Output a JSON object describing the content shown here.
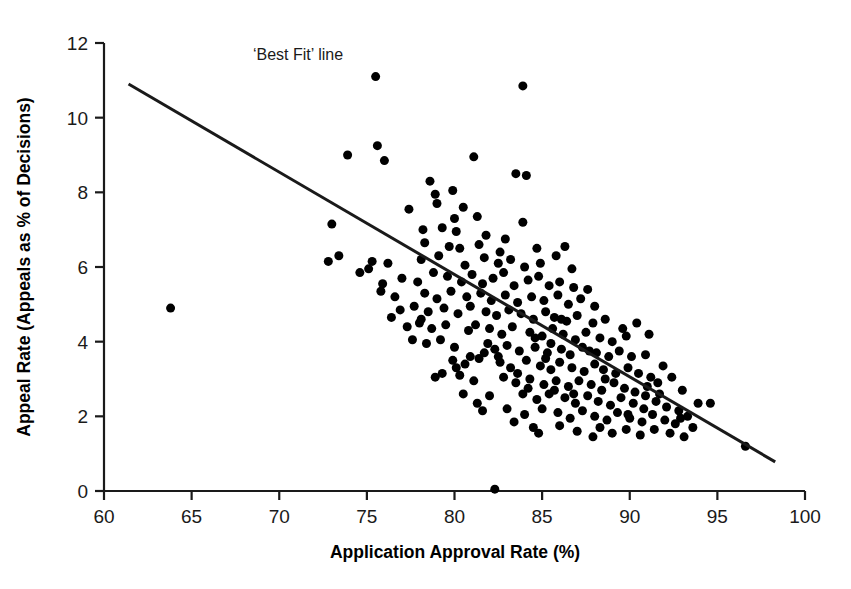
{
  "chart_data": {
    "type": "scatter",
    "title": "",
    "xlabel": "Application Approval Rate (%)",
    "ylabel": "Appeal Rate (Appeals as % of Decisions)",
    "xlim": [
      60,
      100
    ],
    "ylim": [
      0,
      12
    ],
    "xticks": [
      60,
      65,
      70,
      75,
      80,
      85,
      90,
      95,
      100
    ],
    "yticks": [
      0,
      2,
      4,
      6,
      8,
      10,
      12
    ],
    "xtick_labels": [
      "60",
      "65",
      "70",
      "75",
      "80",
      "85",
      "90",
      "95",
      "100"
    ],
    "ytick_labels": [
      "0",
      "2",
      "4",
      "6",
      "8",
      "10",
      "12"
    ],
    "grid": false,
    "legend": false,
    "marker": "filled-circle",
    "marker_color": "#000000",
    "marker_size_px": 9,
    "annotations": [
      {
        "name": "best-fit-line-label",
        "text": "‘Best Fit’ line",
        "x": 68.5,
        "y": 11.55
      }
    ],
    "trendline": {
      "name": "Best Fit line",
      "type": "linear",
      "color": "#1a1a1a",
      "width_px": 3,
      "x_start": 61.4,
      "y_start": 10.9,
      "x_end": 98.3,
      "y_end": 0.78,
      "slope": -0.274,
      "intercept": 27.72
    },
    "series": [
      {
        "name": "Local authorities",
        "points": [
          [
            63.8,
            4.9
          ],
          [
            75.5,
            11.1
          ],
          [
            83.9,
            10.85
          ],
          [
            73.9,
            9.0
          ],
          [
            75.6,
            9.25
          ],
          [
            76.0,
            8.85
          ],
          [
            81.1,
            8.95
          ],
          [
            83.5,
            8.5
          ],
          [
            84.1,
            8.45
          ],
          [
            78.6,
            8.3
          ],
          [
            78.9,
            7.95
          ],
          [
            79.9,
            8.05
          ],
          [
            77.4,
            7.55
          ],
          [
            80.5,
            7.6
          ],
          [
            81.3,
            7.35
          ],
          [
            83.9,
            7.2
          ],
          [
            78.2,
            7.0
          ],
          [
            79.3,
            7.05
          ],
          [
            80.1,
            6.95
          ],
          [
            73.0,
            7.15
          ],
          [
            79.7,
            6.55
          ],
          [
            80.3,
            6.5
          ],
          [
            81.4,
            6.6
          ],
          [
            82.6,
            6.4
          ],
          [
            84.7,
            6.5
          ],
          [
            86.3,
            6.55
          ],
          [
            72.8,
            6.15
          ],
          [
            73.4,
            6.3
          ],
          [
            75.3,
            6.15
          ],
          [
            76.2,
            6.1
          ],
          [
            78.1,
            6.2
          ],
          [
            79.1,
            6.3
          ],
          [
            80.6,
            6.05
          ],
          [
            81.7,
            6.25
          ],
          [
            82.5,
            6.1
          ],
          [
            83.2,
            6.2
          ],
          [
            84.0,
            6.0
          ],
          [
            84.9,
            6.1
          ],
          [
            85.8,
            6.3
          ],
          [
            86.7,
            5.95
          ],
          [
            77.0,
            5.7
          ],
          [
            77.9,
            5.6
          ],
          [
            78.8,
            5.85
          ],
          [
            79.6,
            5.75
          ],
          [
            80.4,
            5.6
          ],
          [
            81.0,
            5.8
          ],
          [
            81.6,
            5.55
          ],
          [
            82.2,
            5.7
          ],
          [
            82.8,
            5.85
          ],
          [
            83.4,
            5.5
          ],
          [
            84.2,
            5.65
          ],
          [
            84.8,
            5.75
          ],
          [
            85.4,
            5.5
          ],
          [
            86.0,
            5.6
          ],
          [
            86.8,
            5.45
          ],
          [
            87.6,
            5.4
          ],
          [
            75.8,
            5.35
          ],
          [
            76.6,
            5.2
          ],
          [
            78.3,
            5.3
          ],
          [
            79.0,
            5.15
          ],
          [
            79.8,
            5.35
          ],
          [
            80.7,
            5.2
          ],
          [
            81.5,
            5.3
          ],
          [
            82.1,
            5.1
          ],
          [
            82.9,
            5.25
          ],
          [
            83.6,
            5.05
          ],
          [
            84.4,
            5.2
          ],
          [
            85.1,
            5.1
          ],
          [
            85.9,
            5.25
          ],
          [
            86.5,
            5.0
          ],
          [
            87.2,
            5.15
          ],
          [
            88.0,
            4.95
          ],
          [
            76.9,
            4.85
          ],
          [
            77.7,
            4.95
          ],
          [
            78.5,
            4.8
          ],
          [
            79.4,
            4.9
          ],
          [
            80.2,
            4.75
          ],
          [
            80.9,
            4.95
          ],
          [
            81.8,
            4.8
          ],
          [
            82.4,
            4.7
          ],
          [
            83.1,
            4.85
          ],
          [
            83.8,
            4.75
          ],
          [
            84.5,
            4.6
          ],
          [
            85.2,
            4.8
          ],
          [
            85.7,
            4.65
          ],
          [
            86.4,
            4.55
          ],
          [
            87.0,
            4.7
          ],
          [
            87.9,
            4.5
          ],
          [
            88.6,
            4.6
          ],
          [
            77.3,
            4.4
          ],
          [
            78.0,
            4.5
          ],
          [
            78.7,
            4.35
          ],
          [
            79.5,
            4.45
          ],
          [
            80.8,
            4.3
          ],
          [
            81.2,
            4.45
          ],
          [
            82.0,
            4.35
          ],
          [
            82.7,
            4.2
          ],
          [
            83.3,
            4.4
          ],
          [
            84.3,
            4.25
          ],
          [
            85.0,
            4.15
          ],
          [
            85.6,
            4.35
          ],
          [
            86.2,
            4.2
          ],
          [
            86.9,
            4.05
          ],
          [
            87.5,
            4.25
          ],
          [
            88.3,
            4.1
          ],
          [
            89.0,
            4.0
          ],
          [
            89.8,
            4.15
          ],
          [
            78.4,
            3.95
          ],
          [
            79.2,
            4.05
          ],
          [
            80.0,
            3.85
          ],
          [
            81.9,
            3.95
          ],
          [
            82.3,
            3.8
          ],
          [
            83.0,
            3.9
          ],
          [
            83.7,
            3.75
          ],
          [
            84.6,
            3.85
          ],
          [
            85.3,
            3.7
          ],
          [
            85.5,
            3.95
          ],
          [
            86.1,
            3.8
          ],
          [
            86.6,
            3.65
          ],
          [
            87.3,
            3.85
          ],
          [
            88.1,
            3.7
          ],
          [
            88.8,
            3.6
          ],
          [
            89.4,
            3.75
          ],
          [
            90.1,
            3.6
          ],
          [
            90.9,
            3.65
          ],
          [
            79.9,
            3.5
          ],
          [
            80.6,
            3.4
          ],
          [
            81.4,
            3.55
          ],
          [
            82.6,
            3.45
          ],
          [
            83.2,
            3.3
          ],
          [
            84.1,
            3.5
          ],
          [
            84.9,
            3.35
          ],
          [
            85.5,
            3.25
          ],
          [
            86.0,
            3.45
          ],
          [
            86.7,
            3.3
          ],
          [
            87.4,
            3.2
          ],
          [
            88.0,
            3.4
          ],
          [
            88.5,
            3.25
          ],
          [
            89.2,
            3.15
          ],
          [
            89.9,
            3.3
          ],
          [
            90.5,
            3.15
          ],
          [
            91.2,
            3.05
          ],
          [
            78.9,
            3.05
          ],
          [
            80.3,
            3.1
          ],
          [
            81.1,
            2.95
          ],
          [
            82.8,
            3.05
          ],
          [
            83.5,
            2.9
          ],
          [
            84.3,
            3.0
          ],
          [
            85.1,
            2.85
          ],
          [
            85.8,
            2.95
          ],
          [
            86.5,
            2.8
          ],
          [
            87.1,
            2.95
          ],
          [
            87.8,
            2.85
          ],
          [
            88.4,
            2.7
          ],
          [
            89.1,
            2.9
          ],
          [
            89.7,
            2.75
          ],
          [
            90.3,
            2.65
          ],
          [
            91.0,
            2.8
          ],
          [
            91.7,
            2.6
          ],
          [
            82.0,
            2.55
          ],
          [
            83.9,
            2.6
          ],
          [
            84.7,
            2.45
          ],
          [
            85.4,
            2.6
          ],
          [
            86.3,
            2.5
          ],
          [
            86.9,
            2.35
          ],
          [
            87.6,
            2.55
          ],
          [
            88.2,
            2.4
          ],
          [
            88.9,
            2.3
          ],
          [
            89.5,
            2.5
          ],
          [
            90.2,
            2.35
          ],
          [
            90.8,
            2.2
          ],
          [
            91.5,
            2.4
          ],
          [
            92.1,
            2.25
          ],
          [
            92.8,
            2.15
          ],
          [
            81.6,
            2.15
          ],
          [
            83.0,
            2.2
          ],
          [
            84.0,
            2.05
          ],
          [
            85.0,
            2.2
          ],
          [
            85.9,
            2.1
          ],
          [
            86.6,
            1.95
          ],
          [
            87.3,
            2.15
          ],
          [
            88.0,
            2.0
          ],
          [
            88.7,
            1.9
          ],
          [
            89.3,
            2.1
          ],
          [
            90.0,
            1.95
          ],
          [
            90.7,
            1.85
          ],
          [
            91.3,
            2.05
          ],
          [
            92.0,
            1.9
          ],
          [
            92.6,
            1.8
          ],
          [
            93.3,
            2.0
          ],
          [
            93.9,
            2.35
          ],
          [
            94.6,
            2.35
          ],
          [
            84.5,
            1.7
          ],
          [
            86.0,
            1.75
          ],
          [
            87.0,
            1.6
          ],
          [
            88.3,
            1.7
          ],
          [
            89.0,
            1.55
          ],
          [
            89.8,
            1.65
          ],
          [
            90.6,
            1.5
          ],
          [
            91.4,
            1.65
          ],
          [
            92.3,
            1.55
          ],
          [
            93.1,
            1.45
          ],
          [
            96.6,
            1.2
          ],
          [
            82.3,
            0.05
          ],
          [
            89.6,
            4.35
          ],
          [
            90.4,
            4.5
          ],
          [
            91.1,
            4.2
          ],
          [
            91.9,
            3.35
          ],
          [
            92.4,
            3.05
          ],
          [
            93.0,
            2.7
          ],
          [
            80.1,
            3.3
          ],
          [
            79.3,
            3.15
          ],
          [
            80.9,
            3.6
          ],
          [
            81.7,
            3.7
          ],
          [
            82.5,
            3.6
          ],
          [
            83.6,
            3.15
          ],
          [
            84.2,
            2.75
          ],
          [
            85.7,
            2.7
          ],
          [
            86.8,
            2.6
          ],
          [
            88.6,
            3.0
          ],
          [
            78.1,
            4.6
          ],
          [
            77.6,
            4.05
          ],
          [
            76.4,
            4.65
          ],
          [
            75.9,
            5.55
          ],
          [
            75.1,
            5.95
          ],
          [
            74.6,
            5.85
          ],
          [
            80.5,
            2.6
          ],
          [
            81.3,
            2.35
          ],
          [
            83.4,
            1.85
          ],
          [
            84.8,
            1.55
          ],
          [
            87.9,
            1.45
          ],
          [
            82.9,
            6.75
          ],
          [
            81.8,
            6.85
          ],
          [
            80.0,
            7.3
          ],
          [
            79.0,
            7.7
          ],
          [
            78.3,
            6.65
          ],
          [
            84.6,
            4.1
          ],
          [
            85.2,
            3.55
          ],
          [
            86.1,
            4.6
          ],
          [
            87.7,
            3.75
          ],
          [
            89.9,
            2.05
          ],
          [
            90.9,
            2.55
          ],
          [
            91.6,
            2.9
          ],
          [
            92.9,
            1.95
          ],
          [
            93.6,
            1.7
          ]
        ]
      }
    ]
  },
  "axes": {
    "x_axis_name": "application-approval-rate-axis",
    "y_axis_name": "appeal-rate-axis"
  }
}
